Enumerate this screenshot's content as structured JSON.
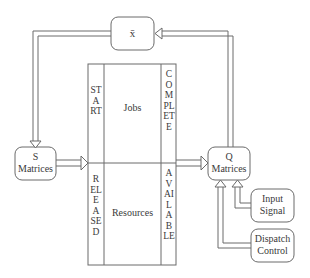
{
  "diagram": {
    "nodes": {
      "xbar": {
        "label": "x̄"
      },
      "s_matrices": {
        "line1": "S",
        "line2": "Matrices"
      },
      "q_matrices": {
        "line1": "Q",
        "line2": "Matrices"
      },
      "input_signal": {
        "line1": "Input",
        "line2": "Signal"
      },
      "dispatch_control": {
        "line1": "Dispatch",
        "line2": "Control"
      }
    },
    "central_block": {
      "top_center": "Jobs",
      "bottom_center": "Resources",
      "top_left_vertical": "START",
      "bottom_left_vertical": "RELEASED",
      "top_right_vertical": "COMPLETE",
      "bottom_right_vertical": "AVAILABLE"
    },
    "edges": [
      {
        "from": "xbar",
        "to": "s_matrices"
      },
      {
        "from": "q_matrices",
        "to": "xbar"
      },
      {
        "from": "s_matrices",
        "to": "central_block"
      },
      {
        "from": "central_block",
        "to": "q_matrices"
      },
      {
        "from": "input_signal",
        "to": "q_matrices"
      },
      {
        "from": "dispatch_control",
        "to": "q_matrices"
      }
    ]
  }
}
